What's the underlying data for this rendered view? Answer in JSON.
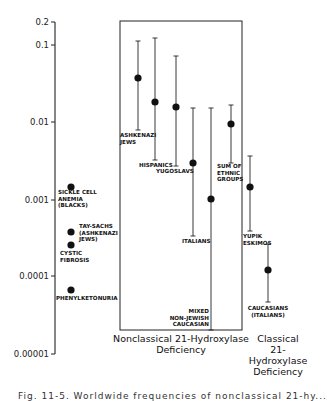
{
  "chart_data": {
    "type": "scatter",
    "title": "",
    "xlabel": "",
    "ylabel": "",
    "yscale": "log",
    "ylim": [
      1e-05,
      0.2
    ],
    "yticks": [
      {
        "value": 0.2,
        "label": "0.2",
        "y": 22
      },
      {
        "value": 0.1,
        "label": "0.1",
        "y": 45
      },
      {
        "value": 0.01,
        "label": "0.01",
        "y": 122
      },
      {
        "value": 0.001,
        "label": "0.001",
        "y": 200
      },
      {
        "value": 0.0001,
        "label": "0.0001",
        "y": 276
      },
      {
        "value": 1e-05,
        "label": "0.00001",
        "y": 354
      }
    ],
    "grid": false,
    "groups": [
      {
        "name": "reference",
        "label": ""
      },
      {
        "name": "nonclassical",
        "label_lines": [
          "Nonclassical  21-Hydroxylase",
          "Deficiency"
        ]
      },
      {
        "name": "classical",
        "label_lines": [
          "Classical",
          "21-",
          "Hydroxylase",
          "Deficiency"
        ]
      }
    ],
    "series": [
      {
        "group": "reference",
        "label_lines": [
          "SICKLE CELL",
          "ANEMIA",
          "(BLACKS)"
        ],
        "value": 0.0015,
        "x": 71,
        "y": 187,
        "label_x": 58,
        "label_y": 194
      },
      {
        "group": "reference",
        "label_lines": [
          "TAY-SACHS",
          "(ASHKENAZI",
          "JEWS)"
        ],
        "value": 0.0004,
        "x": 71,
        "y": 232,
        "label_x": 79,
        "label_y": 228
      },
      {
        "group": "reference",
        "label_lines": [
          "CYSTIC",
          "FIBROSIS"
        ],
        "value": 0.0003,
        "x": 71,
        "y": 245,
        "label_x": 60,
        "label_y": 255
      },
      {
        "group": "reference",
        "label_lines": [
          "PHENYLKETONURIA"
        ],
        "value": 7e-05,
        "x": 71,
        "y": 290,
        "label_x": 56,
        "label_y": 300
      },
      {
        "group": "nonclassical",
        "label_lines": [
          "ASHKENAZI",
          "JEWS"
        ],
        "value": 0.037,
        "upper": 0.11,
        "lower": 0.0078,
        "x": 138,
        "y": 78,
        "top": 41,
        "bottom": 130,
        "label_x": 120,
        "label_y": 137
      },
      {
        "group": "nonclassical",
        "label_lines": [
          "HISPANICS"
        ],
        "value": 0.018,
        "upper": 0.12,
        "lower": 0.0032,
        "x": 155,
        "y": 102,
        "top": 38,
        "bottom": 160,
        "label_x": 139,
        "label_y": 167
      },
      {
        "group": "nonclassical",
        "label_lines": [
          "YUGOSLAVS"
        ],
        "value": 0.016,
        "upper": 0.072,
        "lower": 0.0027,
        "x": 176,
        "y": 107,
        "top": 56,
        "bottom": 166,
        "label_x": 156,
        "label_y": 173
      },
      {
        "group": "nonclassical",
        "label_lines": [
          "ITALIANS"
        ],
        "value": 0.003,
        "upper": 0.015,
        "lower": 0.0003,
        "x": 193,
        "y": 163,
        "top": 108,
        "bottom": 236,
        "label_x": 182,
        "label_y": 243
      },
      {
        "group": "nonclassical",
        "label_lines": [
          "MIXED",
          "NON-JEWISH",
          "CAUCASIAN"
        ],
        "value": 0.001,
        "upper": 0.015,
        "lower": 2e-05,
        "x": 211,
        "y": 199,
        "top": 108,
        "bottom": 330,
        "label_x": 209,
        "label_y": 313,
        "label_anchor": "end"
      },
      {
        "group": "nonclassical",
        "label_lines": [
          "SUM OF",
          "ETHNIC",
          "GROUPS"
        ],
        "value": 0.009,
        "upper": 0.016,
        "lower": 0.003,
        "x": 231,
        "y": 124,
        "top": 105,
        "bottom": 163,
        "label_x": 217,
        "label_y": 168
      },
      {
        "group": "classical",
        "label_lines": [
          "YUPIK",
          "ESKIMOS"
        ],
        "value": 0.0014,
        "upper": 0.0036,
        "lower": 0.00038,
        "x": 250,
        "y": 187,
        "top": 156,
        "bottom": 231,
        "label_x": 243,
        "label_y": 238
      },
      {
        "group": "classical",
        "label_lines": [
          "CAUCASIANS",
          "(ITALIANS)"
        ],
        "value": 0.00012,
        "upper": 0.0002,
        "lower": 5e-05,
        "x": 268,
        "y": 270,
        "top": 244,
        "bottom": 302,
        "label_x": 268,
        "label_y": 310,
        "label_anchor": "middle"
      }
    ],
    "box": {
      "x": 120,
      "y": 21,
      "width": 122,
      "height": 309
    }
  },
  "caption": {
    "text": "Fig. 11-5. Worldwide frequencies of nonclassical 21-hy..."
  }
}
